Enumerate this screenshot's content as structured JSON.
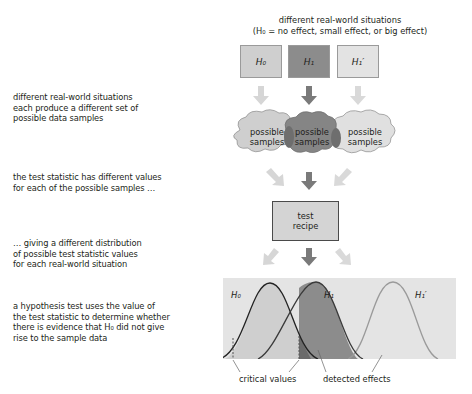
{
  "header": {
    "line1": "different real-world situations",
    "line2": "(H₀ = no effect, small effect, or big effect)"
  },
  "hypotheses": [
    {
      "label": "H₀",
      "color": "#cfcfcf"
    },
    {
      "label": "H₁",
      "color": "#8c8c8c"
    },
    {
      "label": "H₁′",
      "color": "#e3e3e3"
    }
  ],
  "samples": {
    "left": "possible\nsamples",
    "middle": "possible\nsamples",
    "right": "possible\nsamples"
  },
  "recipe": {
    "label": "test\nrecipe"
  },
  "notes": [
    "different real-world situations\neach produce a different set of\npossible data samples",
    "the test statistic has different values\nfor each of the possible samples …",
    "… giving a different distribution\nof possible test statistic values\nfor each real-world situation",
    "a hypothesis test uses the value of\nthe test statistic to determine whether\nthere is evidence that H₀ did not give\nrise to the sample data"
  ],
  "distributions": {
    "h0_label": "H₀",
    "h1_label": "H₁",
    "h1p_label": "H₁′"
  },
  "bottom_labels": {
    "critical": "critical values",
    "detected": "detected effects"
  },
  "colors": {
    "light_fill": "#cfcfcf",
    "dark_fill": "#8c8c8c",
    "pale_fill": "#e3e3e3",
    "panel_bg": "#e4e4e4",
    "arrow_light": "#d6d6d6",
    "arrow_dark": "#7a7a7a"
  }
}
